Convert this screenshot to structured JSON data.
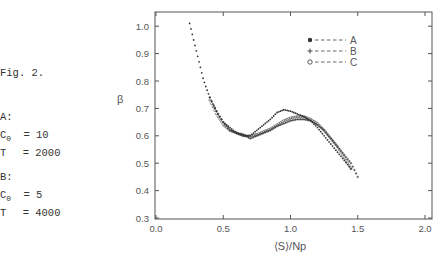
{
  "side_notes": {
    "figure_label": "Fig. 2.",
    "groups": [
      {
        "label": "A:",
        "c0_name": "C",
        "c0_sub": "0",
        "c0_value": "= 10",
        "t_name": "T",
        "t_value": "= 2000"
      },
      {
        "label": "B:",
        "c0_name": "C",
        "c0_sub": "0",
        "c0_value": "= 5",
        "t_name": "T",
        "t_value": "= 4000"
      }
    ]
  },
  "chart_data": {
    "type": "scatter",
    "title": "",
    "xlabel": "⟨S⟩/Np",
    "ylabel": "β",
    "xlim": [
      0.0,
      2.0
    ],
    "ylim": [
      0.3,
      1.05
    ],
    "xticks": [
      "0.0",
      "0.5",
      "1.0",
      "1.5",
      "2.0"
    ],
    "yticks": [
      "0.3",
      "0.4",
      "0.5",
      "0.6",
      "0.7",
      "0.8",
      "0.9",
      "1.0"
    ],
    "grid": false,
    "legend_position": "upper right",
    "series": [
      {
        "name": "A",
        "marker": "filled-circle",
        "x": [
          0.25,
          0.27,
          0.29,
          0.31,
          0.33,
          0.35,
          0.37,
          0.4,
          0.43,
          0.46,
          0.5,
          0.55,
          0.6,
          0.65,
          0.7,
          0.75,
          0.8,
          0.85,
          0.9,
          0.95,
          1.0,
          1.05,
          1.1,
          1.15,
          1.2,
          1.25,
          1.3,
          1.35,
          1.4,
          1.45
        ],
        "y": [
          1.01,
          0.97,
          0.93,
          0.89,
          0.85,
          0.81,
          0.78,
          0.74,
          0.71,
          0.68,
          0.65,
          0.63,
          0.61,
          0.6,
          0.6,
          0.62,
          0.64,
          0.66,
          0.685,
          0.695,
          0.69,
          0.68,
          0.67,
          0.655,
          0.63,
          0.6,
          0.57,
          0.54,
          0.51,
          0.48
        ]
      },
      {
        "name": "B",
        "marker": "plus",
        "x": [
          0.4,
          0.45,
          0.5,
          0.55,
          0.6,
          0.65,
          0.7,
          0.75,
          0.8,
          0.85,
          0.9,
          0.95,
          1.0,
          1.05,
          1.1,
          1.15,
          1.2,
          1.25,
          1.3,
          1.35,
          1.4,
          1.45,
          1.5
        ],
        "y": [
          0.74,
          0.69,
          0.65,
          0.62,
          0.61,
          0.605,
          0.59,
          0.6,
          0.61,
          0.62,
          0.635,
          0.645,
          0.655,
          0.66,
          0.66,
          0.655,
          0.64,
          0.62,
          0.59,
          0.56,
          0.53,
          0.5,
          0.45
        ]
      },
      {
        "name": "C",
        "marker": "open-circle",
        "x": [
          0.4,
          0.45,
          0.5,
          0.55,
          0.6,
          0.65,
          0.7,
          0.75,
          0.8,
          0.85,
          0.9,
          0.95,
          1.0,
          1.05,
          1.1,
          1.15,
          1.2,
          1.25,
          1.3,
          1.35,
          1.4,
          1.45
        ],
        "y": [
          0.73,
          0.68,
          0.64,
          0.62,
          0.61,
          0.6,
          0.6,
          0.605,
          0.615,
          0.625,
          0.64,
          0.655,
          0.665,
          0.67,
          0.67,
          0.66,
          0.645,
          0.62,
          0.59,
          0.56,
          0.52,
          0.48
        ]
      }
    ],
    "legend": [
      {
        "symbol": "●",
        "dash": "- - - -",
        "label": "A"
      },
      {
        "symbol": "+",
        "dash": "- - - -",
        "label": "B"
      },
      {
        "symbol": "o",
        "dash": "- - - -",
        "label": "C"
      }
    ]
  },
  "style": {
    "ink": "#333333",
    "axis": "#555555",
    "background": "#ffffff"
  }
}
